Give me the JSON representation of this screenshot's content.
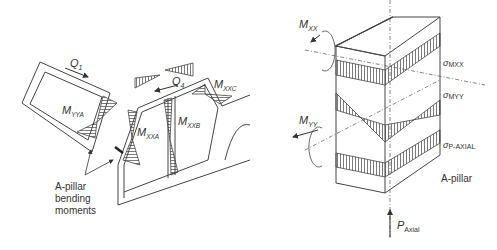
{
  "left_diagram": {
    "loads": {
      "q1": "Q",
      "q1_sub": "1",
      "q4": "Q",
      "q4_sub": "4"
    },
    "moments": {
      "myya": "M",
      "myya_sub": "YYA",
      "mxxa": "M",
      "mxxa_sub": "XXA",
      "mxxb": "M",
      "mxxb_sub": "XXB",
      "mxxc": "M",
      "mxxc_sub": "XXC"
    },
    "annotation": [
      "A-pillar",
      "bending",
      "moments"
    ]
  },
  "right_diagram": {
    "moments": {
      "mxx": "M",
      "mxx_sub": "XX",
      "myy": "M",
      "myy_sub": "YY"
    },
    "stresses": {
      "s_mxx": "σ",
      "s_mxx_sub": "MXX",
      "s_myy": "σ",
      "s_myy_sub": "MYY",
      "s_axial": "σ",
      "s_axial_sub": "P-AXIAL"
    },
    "label": "A-pillar",
    "axial_load": "P",
    "axial_load_sub": "Axial"
  },
  "colors": {
    "line": "#444444",
    "text": "#333333",
    "background": "#ffffff"
  }
}
